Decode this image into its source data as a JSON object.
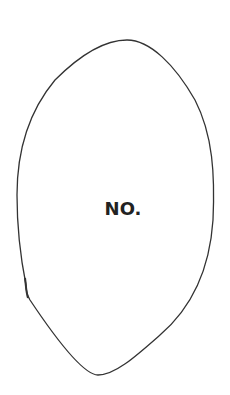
{
  "figure": {
    "label": "NO.",
    "stroke_color": "#333333",
    "background": "#ffffff"
  }
}
